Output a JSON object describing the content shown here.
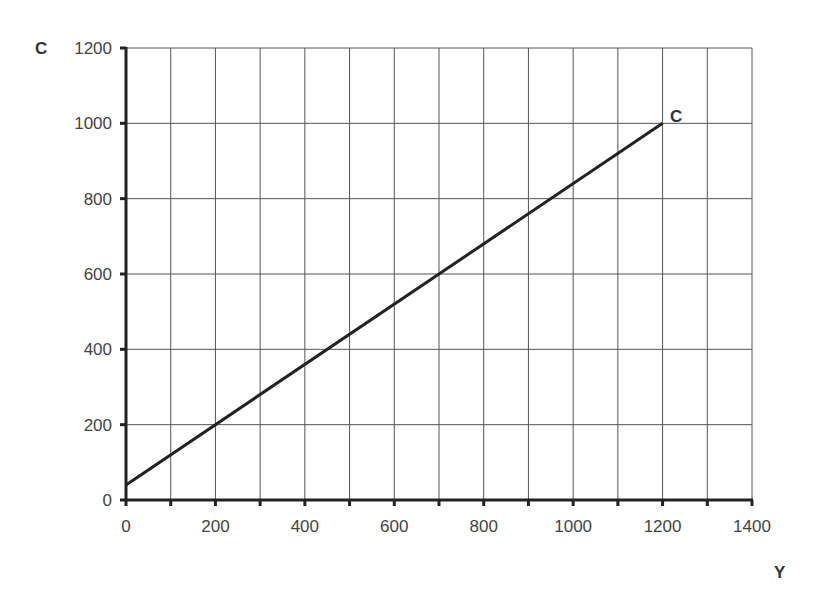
{
  "chart_data": {
    "type": "line",
    "title": "",
    "xlabel": "Y",
    "ylabel": "C",
    "xlim": [
      0,
      1400
    ],
    "ylim": [
      0,
      1200
    ],
    "x_ticks": [
      "0",
      "200",
      "400",
      "600",
      "800",
      "1000",
      "1200",
      "1400"
    ],
    "y_ticks": [
      "0",
      "200",
      "400",
      "600",
      "800",
      "1000",
      "1200"
    ],
    "grid": true,
    "grid_x_step": 100,
    "grid_y_step": 200,
    "legend": "none",
    "series": [
      {
        "name": "C",
        "label": "C",
        "x": [
          0,
          1200
        ],
        "values": [
          40,
          1000
        ],
        "color": "#222222"
      }
    ]
  },
  "colors": {
    "grid": "#555555",
    "axis": "#222222",
    "line": "#222222"
  }
}
